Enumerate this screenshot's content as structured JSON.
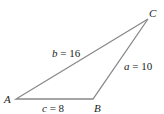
{
  "figure": {
    "type": "triangle",
    "vertices": {
      "A": {
        "label": "A",
        "x": 16,
        "y": 99
      },
      "B": {
        "label": "B",
        "x": 93,
        "y": 99
      },
      "C": {
        "label": "C",
        "x": 148,
        "y": 19
      }
    },
    "sides": {
      "a": {
        "var": "a",
        "eq": " = 10",
        "value": 10
      },
      "b": {
        "var": "b",
        "eq": " = 16",
        "value": 16
      },
      "c": {
        "var": "c",
        "eq": " = 8",
        "value": 8
      }
    },
    "line_color": "#888888",
    "text_color": "#222222"
  }
}
